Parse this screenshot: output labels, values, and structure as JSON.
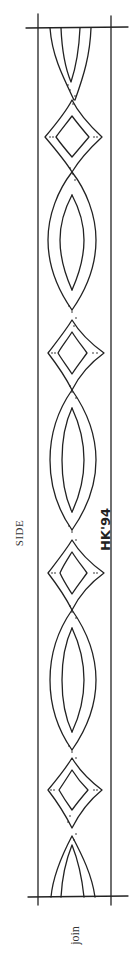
{
  "drawing": {
    "title": "carved strap pattern side elevation",
    "stroke_color": "#222222",
    "background": "#ffffff"
  },
  "labels": {
    "side": "SIDE",
    "join": "join",
    "signature": "HK'94"
  },
  "layout": {
    "border_left_x": 38,
    "border_right_x": 111,
    "top_line_y": 28,
    "bottom_line_y": 897,
    "diamond_centers_y": [
      137,
      353,
      573,
      790
    ],
    "crossing_y": [
      88,
      172,
      310,
      390,
      530,
      610,
      750,
      830
    ],
    "lens_centers_y": [
      240,
      460,
      680
    ]
  }
}
